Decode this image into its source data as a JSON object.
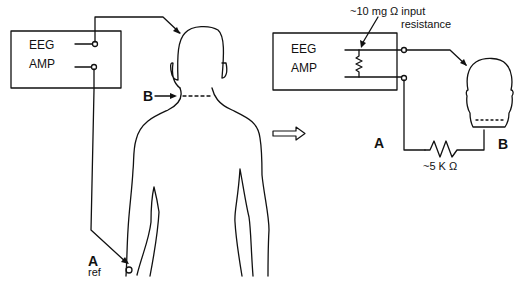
{
  "left_panel": {
    "amplifier": {
      "line1": "EEG",
      "line2": "AMP"
    },
    "label_b": "B",
    "label_a": "A",
    "label_ref": "ref"
  },
  "transition_arrow": "right-arrow-icon",
  "right_panel": {
    "amplifier": {
      "line1": "EEG",
      "line2": "AMP"
    },
    "input_resistance_label_line1": "~10 mg Ω  input",
    "input_resistance_label_line2": "resistance",
    "label_a": "A",
    "label_b": "B",
    "body_resistance_label": "~5 K Ω"
  },
  "colors": {
    "ink": "#111111",
    "background": "#ffffff"
  }
}
